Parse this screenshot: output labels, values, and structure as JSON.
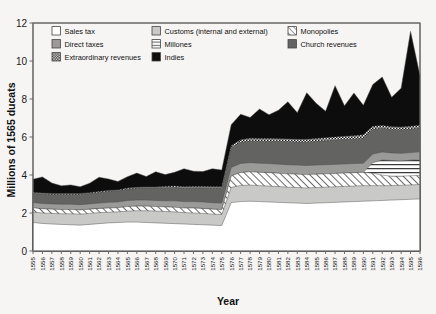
{
  "chart_data": {
    "type": "area",
    "stacked": true,
    "title": "",
    "xlabel": "Year",
    "ylabel": "Millions of 1565 ducats",
    "ylim": [
      0,
      12
    ],
    "yticks": [
      0,
      2,
      4,
      6,
      8,
      10,
      12
    ],
    "grid": false,
    "legend_position": "top-inside",
    "x": [
      1555,
      1556,
      1557,
      1558,
      1559,
      1560,
      1561,
      1562,
      1563,
      1564,
      1565,
      1566,
      1567,
      1568,
      1569,
      1570,
      1571,
      1572,
      1573,
      1574,
      1575,
      1576,
      1577,
      1578,
      1579,
      1580,
      1581,
      1582,
      1583,
      1584,
      1585,
      1586,
      1587,
      1588,
      1589,
      1590,
      1591,
      1592,
      1593,
      1594,
      1595,
      1596
    ],
    "categories": [
      "1555",
      "1556",
      "1557",
      "1558",
      "1559",
      "1560",
      "1561",
      "1562",
      "1563",
      "1564",
      "1565",
      "1566",
      "1567",
      "1568",
      "1569",
      "1570",
      "1571",
      "1572",
      "1573",
      "1574",
      "1575",
      "1576",
      "1577",
      "1578",
      "1579",
      "1580",
      "1581",
      "1582",
      "1583",
      "1584",
      "1585",
      "1586",
      "1587",
      "1588",
      "1589",
      "1590",
      "1591",
      "1592",
      "1593",
      "1594",
      "1595",
      "1596"
    ],
    "series": [
      {
        "name": "Sales tax",
        "pattern": "white",
        "fill": "#ffffff",
        "values": [
          1.5,
          1.45,
          1.42,
          1.4,
          1.38,
          1.36,
          1.4,
          1.44,
          1.48,
          1.5,
          1.52,
          1.52,
          1.5,
          1.48,
          1.46,
          1.44,
          1.42,
          1.4,
          1.38,
          1.36,
          1.34,
          2.55,
          2.6,
          2.62,
          2.6,
          2.58,
          2.56,
          2.54,
          2.52,
          2.5,
          2.52,
          2.54,
          2.56,
          2.58,
          2.6,
          2.62,
          2.64,
          2.66,
          2.68,
          2.7,
          2.72,
          2.74
        ]
      },
      {
        "name": "Customs (internal and external)",
        "pattern": "light-gray",
        "fill": "#c9c9c7",
        "values": [
          0.55,
          0.55,
          0.56,
          0.56,
          0.58,
          0.58,
          0.58,
          0.58,
          0.56,
          0.56,
          0.58,
          0.6,
          0.62,
          0.62,
          0.62,
          0.62,
          0.6,
          0.6,
          0.6,
          0.58,
          0.58,
          0.8,
          0.85,
          0.85,
          0.84,
          0.84,
          0.83,
          0.82,
          0.82,
          0.82,
          0.82,
          0.82,
          0.82,
          0.82,
          0.82,
          0.82,
          0.8,
          0.78,
          0.76,
          0.76,
          0.76,
          0.76
        ]
      },
      {
        "name": "Monopolies",
        "pattern": "diagonal-hatch",
        "fill": "url(#hatchDiag)",
        "values": [
          0.22,
          0.22,
          0.22,
          0.22,
          0.22,
          0.22,
          0.22,
          0.22,
          0.22,
          0.22,
          0.24,
          0.24,
          0.24,
          0.24,
          0.24,
          0.24,
          0.24,
          0.26,
          0.26,
          0.26,
          0.26,
          0.6,
          0.68,
          0.7,
          0.7,
          0.7,
          0.7,
          0.7,
          0.7,
          0.7,
          0.7,
          0.7,
          0.7,
          0.7,
          0.7,
          0.7,
          0.65,
          0.55,
          0.5,
          0.48,
          0.48,
          0.48
        ]
      },
      {
        "name": "Millones",
        "pattern": "horizontal-lines",
        "fill": "url(#hatchHoriz)",
        "values": [
          0,
          0,
          0,
          0,
          0,
          0,
          0,
          0,
          0,
          0,
          0,
          0,
          0,
          0,
          0,
          0,
          0,
          0,
          0,
          0,
          0,
          0,
          0,
          0,
          0,
          0,
          0,
          0,
          0,
          0,
          0,
          0,
          0,
          0,
          0,
          0,
          0.55,
          0.8,
          0.82,
          0.8,
          0.82,
          0.84
        ]
      },
      {
        "name": "Direct taxes",
        "pattern": "mid-gray",
        "fill": "#9a9a98",
        "values": [
          0.28,
          0.28,
          0.28,
          0.28,
          0.28,
          0.28,
          0.28,
          0.28,
          0.3,
          0.3,
          0.32,
          0.32,
          0.32,
          0.32,
          0.32,
          0.34,
          0.34,
          0.34,
          0.34,
          0.34,
          0.34,
          0.45,
          0.48,
          0.48,
          0.48,
          0.48,
          0.48,
          0.48,
          0.48,
          0.48,
          0.48,
          0.48,
          0.48,
          0.48,
          0.48,
          0.48,
          0.46,
          0.42,
          0.4,
          0.4,
          0.4,
          0.4
        ]
      },
      {
        "name": "Church revenues",
        "pattern": "dark-gray",
        "fill": "#636361",
        "values": [
          0.48,
          0.5,
          0.5,
          0.52,
          0.52,
          0.54,
          0.54,
          0.56,
          0.58,
          0.58,
          0.6,
          0.62,
          0.64,
          0.66,
          0.68,
          0.7,
          0.7,
          0.72,
          0.74,
          0.76,
          0.78,
          1.05,
          1.12,
          1.14,
          1.16,
          1.18,
          1.2,
          1.22,
          1.22,
          1.24,
          1.26,
          1.26,
          1.28,
          1.3,
          1.3,
          1.32,
          1.3,
          1.26,
          1.24,
          1.24,
          1.24,
          1.26
        ]
      },
      {
        "name": "Extraordinary revenues",
        "pattern": "checker-dots",
        "fill": "url(#checkerPat)",
        "values": [
          0.05,
          0.05,
          0.05,
          0.05,
          0.05,
          0.05,
          0.05,
          0.05,
          0.05,
          0.05,
          0.05,
          0.05,
          0.05,
          0.05,
          0.08,
          0.08,
          0.08,
          0.08,
          0.08,
          0.08,
          0.08,
          0.1,
          0.12,
          0.14,
          0.14,
          0.14,
          0.14,
          0.14,
          0.14,
          0.14,
          0.14,
          0.16,
          0.16,
          0.16,
          0.16,
          0.18,
          0.16,
          0.14,
          0.14,
          0.14,
          0.14,
          0.14
        ]
      },
      {
        "name": "Indies",
        "pattern": "black",
        "fill": "#0d0d0d",
        "values": [
          0.7,
          0.85,
          0.55,
          0.4,
          0.45,
          0.35,
          0.5,
          0.75,
          0.6,
          0.45,
          0.6,
          0.75,
          0.55,
          0.8,
          0.62,
          0.72,
          0.95,
          0.8,
          0.78,
          0.95,
          0.88,
          1.1,
          1.35,
          1.1,
          1.55,
          1.25,
          1.5,
          1.95,
          1.4,
          2.45,
          1.85,
          1.4,
          2.7,
          1.6,
          2.25,
          1.55,
          2.2,
          2.55,
          1.55,
          2.05,
          5.0,
          2.6
        ]
      }
    ],
    "totals": [
      3.78,
      3.9,
      3.58,
      3.43,
      3.48,
      3.38,
      3.57,
      3.87,
      3.79,
      3.66,
      3.91,
      4.1,
      3.92,
      4.2,
      4.02,
      4.14,
      4.33,
      4.2,
      4.18,
      4.33,
      4.26,
      6.65,
      7.2,
      7.03,
      7.47,
      7.17,
      7.41,
      7.85,
      7.3,
      8.33,
      7.74,
      7.32,
      8.66,
      7.64,
      8.31,
      7.74,
      8.76,
      9.16,
      8.09,
      8.57,
      11.56,
      9.22
    ]
  },
  "legend": {
    "items": [
      {
        "label": "Sales tax",
        "pattern": "white"
      },
      {
        "label": "Customs (internal and external)",
        "pattern": "light-gray"
      },
      {
        "label": "Monopolies",
        "pattern": "diagonal-hatch"
      },
      {
        "label": "Direct taxes",
        "pattern": "mid-gray"
      },
      {
        "label": "Millones",
        "pattern": "horizontal-lines"
      },
      {
        "label": "Church revenues",
        "pattern": "dark-gray"
      },
      {
        "label": "Extraordinary revenues",
        "pattern": "checker-dots"
      },
      {
        "label": "Indies",
        "pattern": "black"
      }
    ]
  },
  "colors": {
    "sales_tax": "#ffffff",
    "customs": "#c9c9c7",
    "direct_taxes": "#9a9a98",
    "church_revenues": "#636361",
    "indies": "#0d0d0d",
    "axis": "#6b6b6b",
    "background": "#f6f5f3"
  }
}
